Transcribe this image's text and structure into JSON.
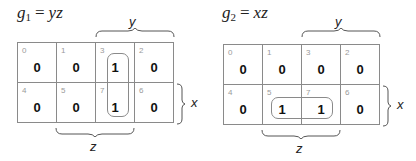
{
  "maps": [
    {
      "id": "g1",
      "title": {
        "var": "g",
        "sub": "1",
        "eq": "=",
        "expr": "yz"
      },
      "labels": {
        "row_var": "x",
        "col_var_top": "y",
        "col_var_bottom": "z"
      },
      "cells": [
        {
          "index": "0",
          "value": "0"
        },
        {
          "index": "1",
          "value": "0"
        },
        {
          "index": "3",
          "value": "1"
        },
        {
          "index": "2",
          "value": "0"
        },
        {
          "index": "4",
          "value": "0"
        },
        {
          "index": "5",
          "value": "0"
        },
        {
          "index": "7",
          "value": "1"
        },
        {
          "index": "6",
          "value": "0"
        }
      ],
      "loop": {
        "cells": [
          "3",
          "7"
        ],
        "orientation": "vertical"
      }
    },
    {
      "id": "g2",
      "title": {
        "var": "g",
        "sub": "2",
        "eq": "=",
        "expr": "xz"
      },
      "labels": {
        "row_var": "x",
        "col_var_top": "y",
        "col_var_bottom": "z"
      },
      "cells": [
        {
          "index": "0",
          "value": "0"
        },
        {
          "index": "1",
          "value": "0"
        },
        {
          "index": "3",
          "value": "0"
        },
        {
          "index": "2",
          "value": "0"
        },
        {
          "index": "4",
          "value": "0"
        },
        {
          "index": "5",
          "value": "1"
        },
        {
          "index": "7",
          "value": "1"
        },
        {
          "index": "6",
          "value": "0"
        }
      ],
      "loop": {
        "cells": [
          "5",
          "7"
        ],
        "orientation": "horizontal"
      }
    }
  ],
  "colors": {
    "grid": "#8a8a8a",
    "index": "#9a9a9a",
    "value": "#111111"
  }
}
